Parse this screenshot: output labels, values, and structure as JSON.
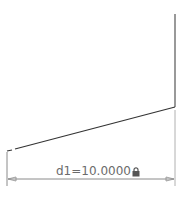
{
  "sketch": {
    "geometry": {
      "right_vertical_line": {
        "x1": 175,
        "y1": 14,
        "x2": 175,
        "y2": 107
      },
      "sloped_line": {
        "x1": 15,
        "y1": 149,
        "x2": 175,
        "y2": 107
      },
      "sloped_line_stub": {
        "x1": 7,
        "y1": 151,
        "x2": 12,
        "y2": 150
      }
    },
    "dimension": {
      "name": "d1",
      "value": "10.0000",
      "label": "d1=10.0000",
      "locked": true,
      "lock_icon": "lock-icon",
      "left_extension": {
        "x": 7,
        "y1": 152,
        "y2": 186
      },
      "right_extension": {
        "x": 175,
        "y1": 110,
        "y2": 186
      },
      "dimension_line_y": 179
    },
    "colors": {
      "geometry": "#333333",
      "dimension": "#8a8a8a",
      "text": "#6b6b6b",
      "background": "#ffffff"
    }
  }
}
